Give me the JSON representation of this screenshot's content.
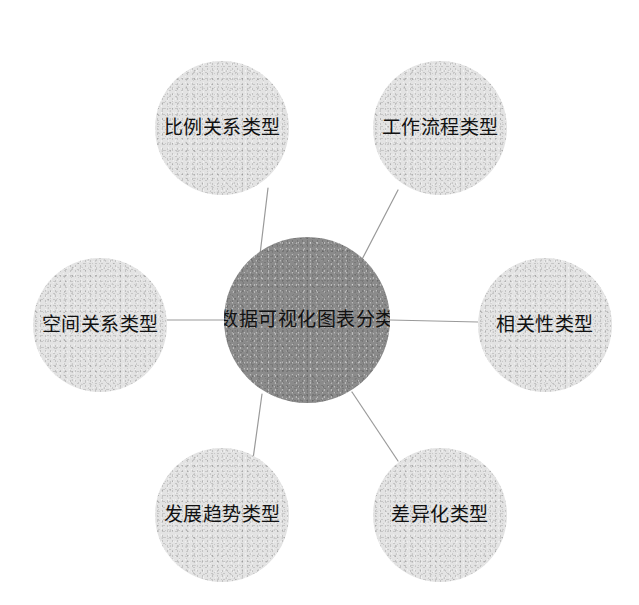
{
  "diagram": {
    "type": "radial-hub-and-spoke",
    "title": "数据可视化图表分类",
    "center": {
      "label": "数据可视化图表分类",
      "fill_color": "#8b8b8b",
      "text_color": "#111111"
    },
    "satellite_fill_color": "#e3e3e3",
    "connector_color": "#9a9a9a",
    "background_color": "#ffffff",
    "nodes": [
      {
        "id": "top-left",
        "label": "比例关系类型"
      },
      {
        "id": "top-right",
        "label": "工作流程类型"
      },
      {
        "id": "left",
        "label": "空间关系类型"
      },
      {
        "id": "right",
        "label": "相关性类型"
      },
      {
        "id": "bottom-left",
        "label": "发展趋势类型"
      },
      {
        "id": "bottom-right",
        "label": "差异化类型"
      }
    ]
  }
}
